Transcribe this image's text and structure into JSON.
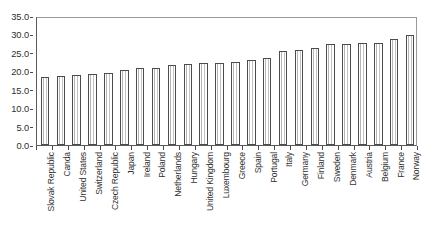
{
  "chart_data": {
    "type": "bar",
    "title": "",
    "subtitle": "",
    "xlabel": "",
    "ylabel": "",
    "ylim": [
      0,
      35
    ],
    "ytick_step": 5,
    "ytick_labels": [
      "0.0",
      "5.0",
      "10.0",
      "15.0",
      "20.0",
      "25.0",
      "30.0",
      "35.0"
    ],
    "ytick_values": [
      0,
      5,
      10,
      15,
      20,
      25,
      30,
      35
    ],
    "grid": false,
    "legend": "none",
    "orientation": "vertical",
    "bar_fill": "#ffffff",
    "bar_edge": "#4c4c4c",
    "categories": [
      "Slovak Republic",
      "Canda",
      "United States",
      "Switzerland",
      "Czech Republic",
      "Japan",
      "Ireland",
      "Poland",
      "Netherlands",
      "Hungary",
      "United Kingdom",
      "Luxembourg",
      "Greece",
      "Spain",
      "Portugal",
      "Italy",
      "Germany",
      "Finland",
      "Sweden",
      "Denmark",
      "Austria",
      "Belgium",
      "France",
      "Norway"
    ],
    "values": [
      18.4,
      18.8,
      19.0,
      19.2,
      19.6,
      20.3,
      20.8,
      20.9,
      21.7,
      22.1,
      22.2,
      22.3,
      22.4,
      23.2,
      23.6,
      25.6,
      25.7,
      26.4,
      27.4,
      27.5,
      27.6,
      27.8,
      28.8,
      29.9
    ]
  }
}
